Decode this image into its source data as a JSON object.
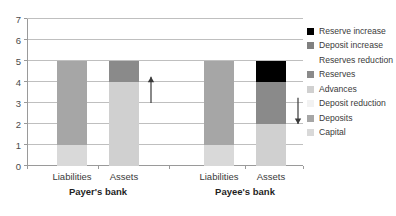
{
  "chart_data": {
    "type": "bar",
    "stacked": true,
    "title": "",
    "xlabel": "",
    "ylabel": "",
    "ylim": [
      0,
      7
    ],
    "ytick_values": [
      0,
      1,
      2,
      3,
      4,
      5,
      6,
      7
    ],
    "ytick_labels": [
      "0",
      "1",
      "2",
      "3",
      "4",
      "5",
      "6",
      "7"
    ],
    "grid": true,
    "legend_position": "right",
    "groups": [
      {
        "name": "Payer's bank",
        "categories": [
          "Liabilities",
          "Assets"
        ]
      },
      {
        "name": "Payee's bank",
        "categories": [
          "Liabilities",
          "Assets"
        ]
      }
    ],
    "categories": [
      "Liabilities",
      "Assets",
      "Liabilities",
      "Assets"
    ],
    "series": [
      {
        "name": "Capital",
        "color": "#d9d9d9",
        "values": [
          1,
          0,
          1,
          0
        ]
      },
      {
        "name": "Deposits",
        "color": "#a6a6a6",
        "values": [
          4,
          0,
          4,
          0
        ]
      },
      {
        "name": "Deposit reduction",
        "color": "#f2f2f2",
        "values": [
          0,
          0,
          0,
          0
        ]
      },
      {
        "name": "Advances",
        "color": "#d0d0d0",
        "values": [
          0,
          0,
          0,
          0
        ]
      },
      {
        "name": "Reserves",
        "color": "#8a8a8a",
        "values": [
          0,
          0,
          0,
          0
        ]
      },
      {
        "name": "Reserves reduction",
        "color": "#ffffff",
        "values": [
          0,
          0,
          0,
          0
        ]
      },
      {
        "name": "Deposit increase",
        "color": "#808080",
        "values": [
          0,
          0,
          0,
          0
        ]
      },
      {
        "name": "Reserve increase",
        "color": "#000000",
        "values": [
          0,
          0,
          0,
          1
        ]
      }
    ],
    "bars": [
      {
        "group": "Payer's bank",
        "category": "Liabilities",
        "total": 5,
        "segments": [
          {
            "series": "Capital",
            "from": 0,
            "to": 1,
            "color": "#d9d9d9"
          },
          {
            "series": "Deposits",
            "from": 1,
            "to": 5,
            "color": "#a6a6a6"
          }
        ]
      },
      {
        "group": "Payer's bank",
        "category": "Assets",
        "total": 5,
        "segments": [
          {
            "series": "Reserves",
            "from": 0,
            "to": 4,
            "color": "#d0d0d0"
          },
          {
            "series": "Advances",
            "from": 4,
            "to": 5,
            "color": "#8a8a8a"
          }
        ]
      },
      {
        "group": "Payee's bank",
        "category": "Liabilities",
        "total": 5,
        "segments": [
          {
            "series": "Capital",
            "from": 0,
            "to": 1,
            "color": "#d9d9d9"
          },
          {
            "series": "Deposits",
            "from": 1,
            "to": 5,
            "color": "#a6a6a6"
          }
        ]
      },
      {
        "group": "Payee's bank",
        "category": "Assets",
        "total": 5,
        "segments": [
          {
            "series": "Reserves",
            "from": 0,
            "to": 2,
            "color": "#d0d0d0"
          },
          {
            "series": "Advances",
            "from": 2,
            "to": 4,
            "color": "#8a8a8a"
          },
          {
            "series": "Reserve increase",
            "from": 4,
            "to": 5,
            "color": "#000000"
          }
        ]
      }
    ],
    "annotations": [
      {
        "name": "payer-up-arrow",
        "direction": "up",
        "from": 3.0,
        "to": 4.25,
        "color": "#3a3a3a"
      },
      {
        "name": "payee-down-arrow",
        "direction": "down",
        "from": 3.25,
        "to": 2.0,
        "color": "#3a3a3a"
      }
    ],
    "legend": [
      {
        "label": "Reserve increase",
        "color": "#000000"
      },
      {
        "label": "Deposit increase",
        "color": "#808080"
      },
      {
        "label": "Reserves reduction",
        "color": "#ffffff"
      },
      {
        "label": "Reserves",
        "color": "#8a8a8a"
      },
      {
        "label": "Advances",
        "color": "#d0d0d0"
      },
      {
        "label": "Deposit reduction",
        "color": "#f2f2f2"
      },
      {
        "label": "Deposits",
        "color": "#a6a6a6"
      },
      {
        "label": "Capital",
        "color": "#d9d9d9"
      }
    ]
  }
}
